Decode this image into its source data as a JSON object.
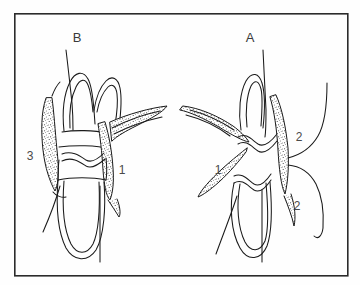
{
  "figure": {
    "title": "",
    "background_color": "#fefefe",
    "ink_color": "#1a1a1a",
    "frame": {
      "name": "figure-border",
      "x": 14,
      "y": 13,
      "width": 334,
      "height": 263,
      "stroke_width": 1.6,
      "color": "#2b2b2b"
    },
    "page_number": "",
    "panels": [
      {
        "id": "panel-b",
        "label": "B",
        "x": 77,
        "y": 37
      },
      {
        "id": "panel-a",
        "label": "A",
        "x": 250,
        "y": 37
      }
    ],
    "callouts": [
      {
        "id": "callout-3-left",
        "label": "3",
        "x": 30,
        "y": 156,
        "side": "B"
      },
      {
        "id": "callout-1-left",
        "label": "1",
        "x": 122,
        "y": 170,
        "side": "B"
      },
      {
        "id": "callout-1-right",
        "label": "1",
        "x": 218,
        "y": 170,
        "side": "A"
      },
      {
        "id": "callout-2-upper",
        "label": "2",
        "x": 299,
        "y": 137,
        "side": "A"
      },
      {
        "id": "callout-2-lower",
        "label": "2",
        "x": 297,
        "y": 206,
        "side": "A"
      }
    ],
    "caption": ""
  }
}
